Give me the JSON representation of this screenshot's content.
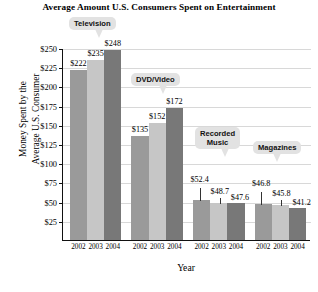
{
  "chart_data": {
    "type": "bar",
    "title": "Average Amount U.S. Consumers Spent on Entertainment",
    "xlabel": "Year",
    "ylabel_line1": "Money Spent by the",
    "ylabel_line2": "Average U.S. Consumer",
    "ylim": [
      0,
      250
    ],
    "ytick_values": [
      25,
      50,
      75,
      100,
      125,
      150,
      175,
      200,
      225,
      250
    ],
    "ytick_labels": [
      "$25",
      "$50",
      "$75",
      "$100",
      "$125",
      "$150",
      "$175",
      "$200",
      "$225",
      "$250"
    ],
    "grid": true,
    "legend": "none",
    "categories": [
      "2002",
      "2003",
      "2004"
    ],
    "groups": [
      {
        "name": "Television",
        "callout": [
          "Television"
        ],
        "bars": [
          {
            "year": "2002",
            "value": 222,
            "label": "$222",
            "color": "#9a9a9a"
          },
          {
            "year": "2003",
            "value": 235,
            "label": "$235",
            "color": "#c6c6c6"
          },
          {
            "year": "2004",
            "value": 248,
            "label": "$248",
            "color": "#787878"
          }
        ]
      },
      {
        "name": "DVD/Video",
        "callout": [
          "DVD/Video"
        ],
        "bars": [
          {
            "year": "2002",
            "value": 135,
            "label": "$135",
            "color": "#9a9a9a"
          },
          {
            "year": "2003",
            "value": 152,
            "label": "$152",
            "color": "#c6c6c6"
          },
          {
            "year": "2004",
            "value": 172,
            "label": "$172",
            "color": "#787878"
          }
        ]
      },
      {
        "name": "Recorded Music",
        "callout": [
          "Recorded",
          "Music"
        ],
        "bars": [
          {
            "year": "2002",
            "value": 52.4,
            "label": "$52.4",
            "color": "#9a9a9a"
          },
          {
            "year": "2003",
            "value": 48.7,
            "label": "$48.7",
            "color": "#c6c6c6"
          },
          {
            "year": "2004",
            "value": 47.6,
            "label": "$47.6",
            "color": "#787878"
          }
        ]
      },
      {
        "name": "Magazines",
        "callout": [
          "Magazines"
        ],
        "bars": [
          {
            "year": "2002",
            "value": 46.8,
            "label": "$46.8",
            "color": "#9a9a9a"
          },
          {
            "year": "2003",
            "value": 45.8,
            "label": "$45.8",
            "color": "#c6c6c6"
          },
          {
            "year": "2004",
            "value": 41.2,
            "label": "$41.2",
            "color": "#787878"
          }
        ]
      }
    ]
  }
}
